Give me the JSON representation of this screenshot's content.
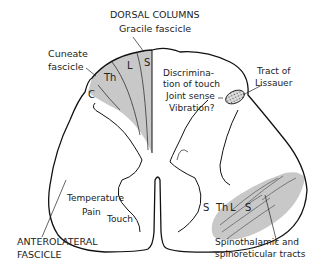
{
  "labels": {
    "dorsal_columns": "DORSAL COLUMNS",
    "gracile": "Gracile fascicle",
    "cuneate_1": "Cuneate",
    "cuneate_2": "fascicle",
    "dc_func_1": "Discrimina-",
    "dc_func_2": "tion of touch",
    "dc_func_3": "Joint sense",
    "dc_func_4": "Vibration?",
    "lissauer_1": "Tract of",
    "lissauer_2": "Lissauer",
    "al_func_1": "Temperature",
    "al_func_2": "Pain",
    "al_func_3": "Touch",
    "anterolateral_1": "ANTEROLATERAL",
    "anterolateral_2": "FASCICLE",
    "spinothal_1": "Spinothalamic and",
    "spinothal_2": "spinoreticular tracts"
  },
  "dorsal_segments": [
    "C",
    "Th",
    "L",
    "S"
  ],
  "ventral_segments": [
    "S",
    "Th",
    "L",
    "S"
  ],
  "colors": {
    "outline": "#111111",
    "shade": "#c8c8c8",
    "hatch": "#999999"
  }
}
